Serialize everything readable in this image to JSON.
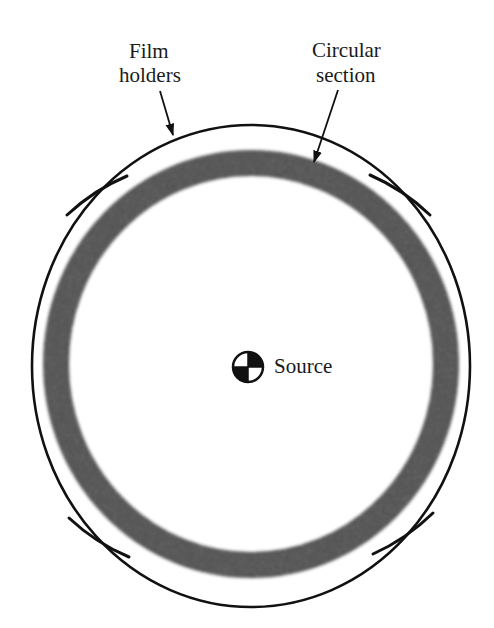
{
  "diagram": {
    "labels": {
      "film_holders": [
        "Film",
        "holders"
      ],
      "circular_section": [
        "Circular",
        "section"
      ],
      "source": "Source"
    },
    "colors": {
      "line": "#111111",
      "band": "#1c1c1c",
      "background": "#ffffff"
    },
    "geometry": {
      "outer_ring": {
        "cx": 251,
        "cy": 366,
        "rx": 219,
        "ry": 241
      },
      "circular_section": {
        "cx": 251,
        "cy": 364,
        "rx": 195,
        "ry": 201,
        "thickness": 26
      },
      "source": {
        "cx": 248,
        "cy": 367,
        "r": 15
      },
      "film_holders": [
        {
          "id": "top-left",
          "from": [
            67,
            215
          ],
          "to": [
            127,
            176
          ]
        },
        {
          "id": "top-right",
          "from": [
            370,
            175
          ],
          "to": [
            430,
            215
          ]
        },
        {
          "id": "bottom-left",
          "from": [
            69,
            518
          ],
          "to": [
            129,
            557
          ]
        },
        {
          "id": "bottom-right",
          "from": [
            373,
            554
          ],
          "to": [
            433,
            513
          ]
        }
      ],
      "arrows": [
        {
          "id": "film-holders-arrow",
          "from": [
            160,
            91
          ],
          "to": [
            173,
            135
          ]
        },
        {
          "id": "circular-section-arrow",
          "from": [
            338,
            90
          ],
          "to": [
            314,
            162
          ]
        }
      ]
    }
  }
}
